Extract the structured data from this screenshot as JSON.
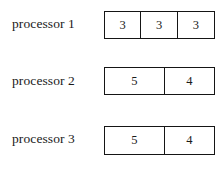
{
  "diagram": {
    "type": "processor-schedule-bars",
    "rows": [
      {
        "label": "processor 1",
        "cells": [
          {
            "value": "3"
          },
          {
            "value": "3"
          },
          {
            "value": "3"
          }
        ]
      },
      {
        "label": "processor 2",
        "cells": [
          {
            "value": "5"
          },
          {
            "value": "4"
          }
        ]
      },
      {
        "label": "processor 3",
        "cells": [
          {
            "value": "5"
          },
          {
            "value": "4"
          }
        ]
      }
    ]
  },
  "colors": {
    "background": "#ffffff",
    "border": "#151515",
    "text": "#1a1a1a",
    "cell_fill": "#ffffff"
  }
}
